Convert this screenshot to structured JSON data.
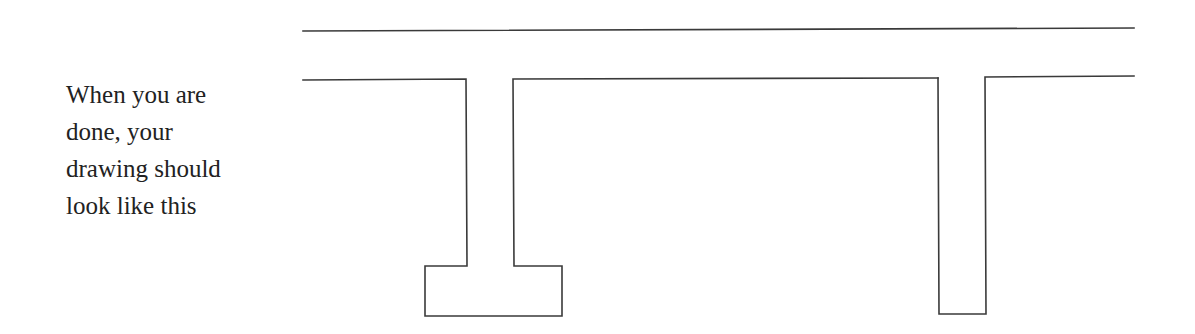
{
  "instruction": {
    "lines": [
      "When you are",
      "done, your",
      "drawing should",
      "look like this"
    ]
  },
  "drawing": {
    "description": "Cross-section outline: a top flange line above a slab profile with two downward stems; the left stem ends in a wide rectangular footing, the right stem ends squarely.",
    "stroke_color": "#3a3a3a",
    "top_line": {
      "x1": 303,
      "y1": 31,
      "x2": 1134,
      "y2": 28
    },
    "slab_left_segment": [
      [
        303,
        80
      ],
      [
        466,
        79
      ],
      [
        467,
        266
      ],
      [
        425,
        266
      ],
      [
        425,
        316
      ],
      [
        562,
        316
      ],
      [
        562,
        266
      ],
      [
        514,
        266
      ],
      [
        513,
        79
      ],
      [
        938,
        78
      ]
    ],
    "right_stem": [
      [
        938,
        78
      ],
      [
        939,
        314
      ],
      [
        986,
        314
      ],
      [
        985,
        77
      ],
      [
        1134,
        76
      ]
    ]
  }
}
